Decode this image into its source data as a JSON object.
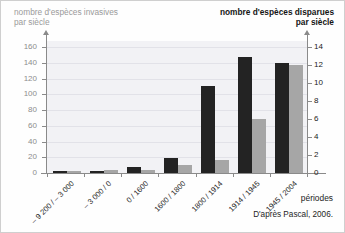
{
  "chart_data": {
    "type": "bar",
    "title": "",
    "categories": [
      "– 9 200 / – 3 000",
      "– 3 000 / 0",
      "0 / 1600",
      "1600 / 1800",
      "1800 / 1914",
      "1914 / 1945",
      "1945 / 2004"
    ],
    "xlabel": "périodes",
    "grid": true,
    "legend": "none",
    "series": [
      {
        "name": "nombre d'espèces invasives par siècle",
        "axis": "left",
        "color": "#232323",
        "values": [
          3,
          3,
          8,
          19,
          111,
          148,
          140
        ]
      },
      {
        "name": "nombre d'espèces disparues par siècle",
        "axis": "right",
        "color": "#a6a6a6",
        "values": [
          0.2,
          0.3,
          0.3,
          0.9,
          1.5,
          6.0,
          12.0
        ]
      }
    ],
    "left_axis": {
      "label": "nombre d'espèces invasives\npar siècle",
      "ticks": [
        0,
        20,
        40,
        60,
        80,
        100,
        120,
        140,
        160
      ],
      "ylim": [
        0,
        168
      ],
      "color": "#9a9a9a"
    },
    "right_axis": {
      "label": "nombre d'espèces disparues\npar siècle",
      "ticks": [
        0,
        2,
        4,
        6,
        8,
        10,
        12,
        14
      ],
      "ylim": [
        0,
        14.7
      ],
      "color": "#151515"
    },
    "annotations": [
      "D'après Pascal, 2006."
    ]
  },
  "source_note": "D'après Pascal, 2006."
}
